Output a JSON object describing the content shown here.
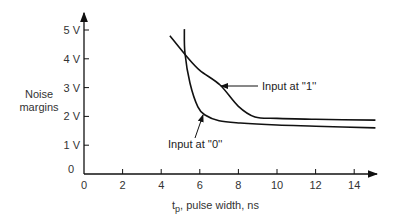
{
  "chart_data": {
    "type": "line",
    "title": "",
    "xlabel": "t_p, pulse width, ns",
    "xlabel_parts": {
      "symbol": "t",
      "subscript": "p",
      "rest": ", pulse width, ns"
    },
    "ylabel": "Noise margins",
    "ylabel_lines": [
      "Noise",
      "margins"
    ],
    "xlim": [
      0,
      15
    ],
    "ylim": [
      0,
      5.3
    ],
    "x_ticks": [
      0,
      2,
      4,
      6,
      8,
      10,
      12,
      14
    ],
    "x_tick_labels": [
      "0",
      "2",
      "4",
      "6",
      "8",
      "10",
      "12",
      "14"
    ],
    "y_ticks": [
      0,
      1,
      2,
      3,
      4,
      5
    ],
    "y_tick_labels": [
      "0",
      "1 V",
      "2 V",
      "3 V",
      "4 V",
      "5 V"
    ],
    "grid": false,
    "legend": "none (inline annotations with arrows)",
    "series": [
      {
        "name": "Input at ''1''",
        "x": [
          4.45,
          5.3,
          6.0,
          7.05,
          8.0,
          8.86,
          10,
          12,
          15.1
        ],
        "y": [
          4.8,
          4.1,
          3.6,
          3.09,
          2.35,
          1.98,
          1.93,
          1.9,
          1.87
        ]
      },
      {
        "name": "Input at ''0''",
        "x": [
          5.2,
          5.23,
          5.49,
          5.9,
          6.27,
          7.0,
          8.1,
          10,
          12,
          15.1
        ],
        "y": [
          5.03,
          4.2,
          3.16,
          2.33,
          2.05,
          1.85,
          1.77,
          1.7,
          1.66,
          1.6
        ]
      }
    ],
    "annotations": [
      {
        "text": "Input at ''1''",
        "arrow_to": [
          7.0,
          3.1
        ]
      },
      {
        "text": "Input at ''0''",
        "arrow_to": [
          6.15,
          2.1
        ]
      }
    ]
  }
}
